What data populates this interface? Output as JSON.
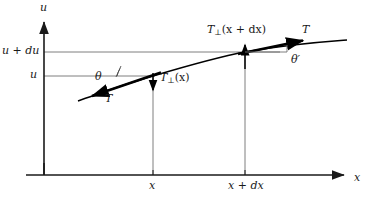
{
  "figure": {
    "type": "vector-diagram",
    "colors": {
      "background": "#ffffff",
      "axis": "#1a1a1a",
      "guide_line": "#6b6b6b",
      "curve": "#000000",
      "tangent": "#000000",
      "text": "#1a1a1a"
    },
    "axes": {
      "vertical_label": "u",
      "horizontal_label": "x",
      "origin": {
        "x": 44,
        "y": 175
      },
      "vertical_top": 20,
      "horizontal_right": 345
    },
    "y_ticks": [
      {
        "label": "u + du",
        "value_y": 52
      },
      {
        "label": "u",
        "value_y": 76
      }
    ],
    "x_ticks": [
      {
        "label": "x",
        "value_x": 153
      },
      {
        "label": "x + dx",
        "value_x": 245
      }
    ],
    "curve": {
      "description": "concave-down string profile u(x)",
      "points": [
        [
          78,
          101
        ],
        [
          110,
          90
        ],
        [
          153,
          76
        ],
        [
          200,
          62
        ],
        [
          245,
          52
        ],
        [
          300,
          45
        ],
        [
          345,
          41
        ]
      ]
    },
    "vectors": [
      {
        "name": "T-lower-left",
        "label": "T",
        "label_pos": [
          108,
          98
        ],
        "from": [
          160,
          73
        ],
        "to": [
          90,
          97
        ],
        "style": "thick-tangent-arrow"
      },
      {
        "name": "T-perp-at-x",
        "label": "T⊥(x)",
        "label_text": "T",
        "label_sub": "⊥",
        "label_arg": "(x)",
        "label_pos": [
          161,
          77
        ],
        "from": [
          153,
          74
        ],
        "to": [
          153,
          93
        ],
        "style": "thin-down-arrow"
      },
      {
        "name": "T-perp-at-x-plus-dx",
        "label": "T⊥(x + dx)",
        "label_text": "T",
        "label_sub": "⊥",
        "label_arg": "(x + dx)",
        "label_pos": [
          209,
          29
        ],
        "from": [
          245,
          70
        ],
        "to": [
          245,
          43
        ],
        "style": "thin-up-arrow"
      },
      {
        "name": "T-upper-right",
        "label": "T",
        "label_pos": [
          303,
          29
        ],
        "from": [
          238,
          54
        ],
        "to": [
          310,
          39
        ],
        "style": "thick-tangent-arrow"
      }
    ],
    "angles": [
      {
        "name": "theta",
        "label": "θ",
        "label_pos": [
          98,
          70
        ],
        "vertex": [
          153,
          76
        ]
      },
      {
        "name": "theta-prime",
        "label": "θ′",
        "label_pos": [
          294,
          56
        ],
        "vertex": [
          245,
          52
        ]
      }
    ],
    "guides": [
      {
        "name": "guide-u-plus-du",
        "from": [
          44,
          52
        ],
        "to": [
          280,
          52
        ]
      },
      {
        "name": "guide-u",
        "from": [
          44,
          76
        ],
        "to": [
          153,
          76
        ]
      },
      {
        "name": "drop-x",
        "from": [
          153,
          76
        ],
        "to": [
          153,
          175
        ]
      },
      {
        "name": "drop-x-plus-dx",
        "from": [
          245,
          52
        ],
        "to": [
          245,
          175
        ]
      }
    ]
  }
}
